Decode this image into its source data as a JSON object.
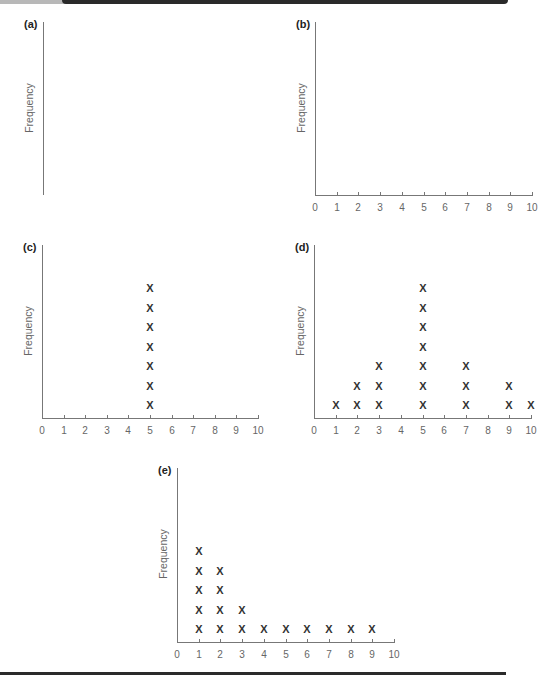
{
  "chart_data": [
    {
      "id": "a",
      "type": "dot_plot",
      "panel_label": "(a)",
      "ylabel": "Frequency",
      "xlabel": "",
      "x_axis_shown": false,
      "x_ticks": [],
      "points": []
    },
    {
      "id": "b",
      "type": "dot_plot",
      "panel_label": "(b)",
      "ylabel": "Frequency",
      "xlabel": "",
      "x_axis_shown": true,
      "xlim": [
        0,
        10
      ],
      "x_ticks": [
        "0",
        "1",
        "2",
        "3",
        "4",
        "5",
        "6",
        "7",
        "8",
        "9",
        "10"
      ],
      "points": []
    },
    {
      "id": "c",
      "type": "dot_plot",
      "panel_label": "(c)",
      "ylabel": "Frequency",
      "xlabel": "",
      "x_axis_shown": true,
      "xlim": [
        0,
        10
      ],
      "x_ticks": [
        "0",
        "1",
        "2",
        "3",
        "4",
        "5",
        "6",
        "7",
        "8",
        "9",
        "10"
      ],
      "marker": "X",
      "points": [
        {
          "x": 5,
          "count": 7
        }
      ]
    },
    {
      "id": "d",
      "type": "dot_plot",
      "panel_label": "(d)",
      "ylabel": "Frequency",
      "xlabel": "",
      "x_axis_shown": true,
      "xlim": [
        0,
        10
      ],
      "x_ticks": [
        "0",
        "1",
        "2",
        "3",
        "4",
        "5",
        "6",
        "7",
        "8",
        "9",
        "10"
      ],
      "marker": "X",
      "points": [
        {
          "x": 1,
          "count": 1
        },
        {
          "x": 2,
          "count": 2
        },
        {
          "x": 3,
          "count": 3
        },
        {
          "x": 5,
          "count": 7
        },
        {
          "x": 7,
          "count": 3
        },
        {
          "x": 9,
          "count": 2
        },
        {
          "x": 10,
          "count": 1
        }
      ]
    },
    {
      "id": "e",
      "type": "dot_plot",
      "panel_label": "(e)",
      "ylabel": "Frequency",
      "xlabel": "",
      "x_axis_shown": true,
      "xlim": [
        0,
        10
      ],
      "x_ticks": [
        "0",
        "1",
        "2",
        "3",
        "4",
        "5",
        "6",
        "7",
        "8",
        "9",
        "10"
      ],
      "marker": "X",
      "points": [
        {
          "x": 1,
          "count": 5
        },
        {
          "x": 2,
          "count": 4
        },
        {
          "x": 3,
          "count": 2
        },
        {
          "x": 4,
          "count": 1
        },
        {
          "x": 5,
          "count": 1
        },
        {
          "x": 6,
          "count": 1
        },
        {
          "x": 7,
          "count": 1
        },
        {
          "x": 8,
          "count": 1
        },
        {
          "x": 9,
          "count": 1
        }
      ]
    }
  ],
  "layout": {
    "panels": {
      "a": {
        "ox": 43,
        "oy": 195,
        "top": 22,
        "width": 217
      },
      "b": {
        "ox": 315,
        "oy": 195,
        "top": 22,
        "width": 217
      },
      "c": {
        "ox": 42,
        "oy": 418,
        "top": 245,
        "width": 216
      },
      "d": {
        "ox": 314,
        "oy": 418,
        "top": 245,
        "width": 217
      },
      "e": {
        "ox": 177,
        "oy": 642,
        "top": 468,
        "width": 217
      }
    },
    "mark_spacing": 19.5,
    "first_mark_offset": 13,
    "colors": {
      "axis": "#777777",
      "mark": "#333333",
      "rule": "#2a2a2a"
    }
  }
}
